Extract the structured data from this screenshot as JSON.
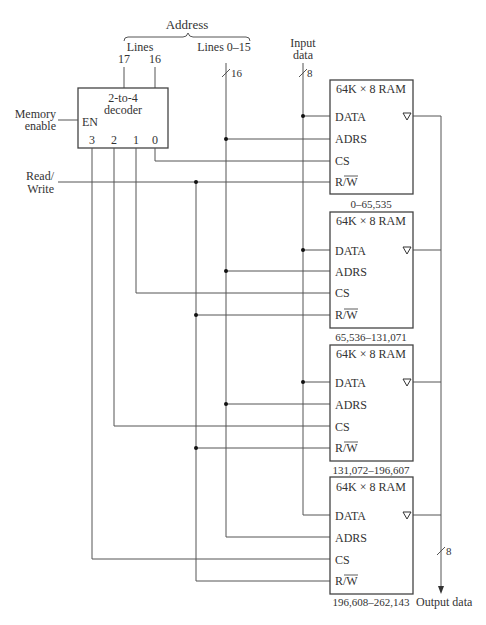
{
  "address": {
    "title": "Address",
    "lines_label": "Lines",
    "line17": "17",
    "line16": "16",
    "lines_low": "Lines 0–15",
    "bus_width_addr": "16"
  },
  "input": {
    "label_line1": "Input",
    "label_line2": "data",
    "bus_width": "8"
  },
  "decoder": {
    "title_line1": "2-to-4",
    "title_line2": "decoder",
    "enable": "EN",
    "outputs": [
      "3",
      "2",
      "1",
      "0"
    ]
  },
  "left_labels": {
    "memory_enable_1": "Memory",
    "memory_enable_2": "enable",
    "read_write_1": "Read/",
    "read_write_2": "Write"
  },
  "rams": [
    {
      "title": "64K × 8 RAM",
      "pins": [
        "DATA",
        "ADRS",
        "CS",
        "R/W"
      ],
      "range": "0–65,535"
    },
    {
      "title": "64K × 8 RAM",
      "pins": [
        "DATA",
        "ADRS",
        "CS",
        "R/W"
      ],
      "range": "65,536–131,071"
    },
    {
      "title": "64K × 8 RAM",
      "pins": [
        "DATA",
        "ADRS",
        "CS",
        "R/W"
      ],
      "range": "131,072–196,607"
    },
    {
      "title": "64K × 8 RAM",
      "pins": [
        "DATA",
        "ADRS",
        "CS",
        "R/W"
      ],
      "range": "196,608–262,143"
    }
  ],
  "output": {
    "label": "Output data",
    "bus_width": "8"
  },
  "colors": {
    "wire": "#555555",
    "text": "#333333",
    "background": "#ffffff"
  }
}
